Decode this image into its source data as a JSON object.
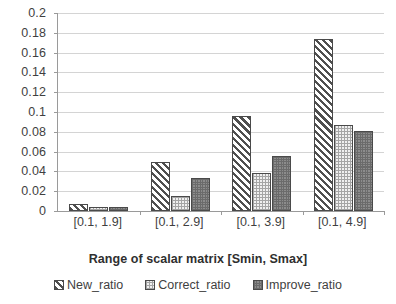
{
  "chart_data": {
    "type": "bar",
    "title": "",
    "subtitle": "",
    "xlabel": "Range of scalar matrix [Smin, Smax]",
    "ylabel": "",
    "categories": [
      "[0.1, 1.9]",
      "[0.1, 2.9]",
      "[0.1, 3.9]",
      "[0.1, 4.9]"
    ],
    "series": [
      {
        "name": "New_ratio",
        "values": [
          0.0075,
          0.0495,
          0.0958,
          0.174
        ],
        "pattern": "diagonal-hatch",
        "color": "#4f4f4f"
      },
      {
        "name": "Correct_ratio",
        "values": [
          0.004,
          0.0152,
          0.038,
          0.0868
        ],
        "pattern": "light-grid",
        "color": "#f0f0f0"
      },
      {
        "name": "Improve_ratio",
        "values": [
          0.0038,
          0.0335,
          0.0555,
          0.0813
        ],
        "pattern": "gray-checker",
        "color": "#8c8c8c"
      }
    ],
    "ylim": [
      0,
      0.2
    ],
    "ytick_step": 0.02,
    "yticks": [
      0.2,
      0.18,
      0.16,
      0.14,
      0.12,
      0.1,
      0.08,
      0.06,
      0.04,
      0.02,
      0
    ],
    "ytick_labels": [
      "0.2",
      "0.18",
      "0.16",
      "0.14",
      "0.12",
      "0.1",
      "0.08",
      "0.06",
      "0.04",
      "0.02",
      "0"
    ],
    "grid": true,
    "grid_axis": "y",
    "legend_position": "bottom",
    "legend": [
      "New_ratio",
      "Correct_ratio",
      "Improve_ratio"
    ],
    "axis_color": "#9a9a9a",
    "grid_color": "#d4d4d4",
    "background": "#ffffff"
  }
}
